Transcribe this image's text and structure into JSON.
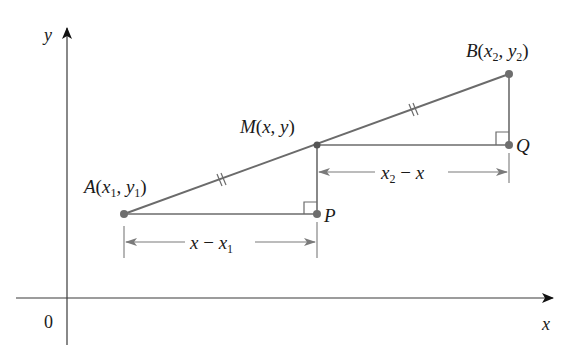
{
  "axes": {
    "x_label": "x",
    "y_label": "y",
    "origin_label": "0",
    "color": "#3a3a3a"
  },
  "points": {
    "A": {
      "name": "A",
      "sub_x": "1",
      "sub_y": "1",
      "label": "A(x1, y1)"
    },
    "B": {
      "name": "B",
      "sub_x": "2",
      "sub_y": "2",
      "label": "B(x2, y2)"
    },
    "M": {
      "name": "M",
      "label": "M(x, y)"
    },
    "P": {
      "name": "P",
      "label": "P"
    },
    "Q": {
      "name": "Q",
      "label": "Q"
    }
  },
  "dimensions": {
    "lower": {
      "label": "x − x1",
      "text_main": "x − x",
      "sub": "1"
    },
    "upper": {
      "label": "x2 − x",
      "text_main": "x",
      "sub": "2",
      "tail": " − x"
    }
  },
  "annotations": {
    "equal_segments": "AM = MB (double tick marks)",
    "right_angles": [
      "at P",
      "at Q"
    ]
  },
  "colors": {
    "segment": "#6b6b6b",
    "point": "#6e6e6e",
    "dimension": "#7a7a7a",
    "text": "#1a1a1a"
  }
}
